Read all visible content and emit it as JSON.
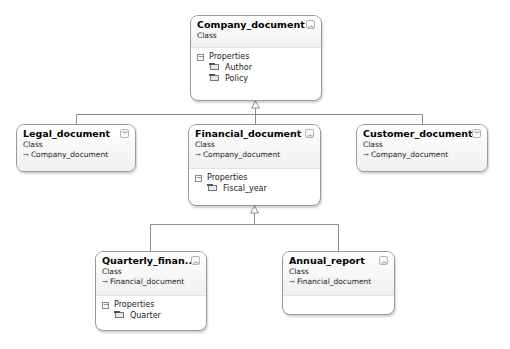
{
  "diagram": {
    "type": "class-diagram",
    "classes": [
      {
        "id": "company",
        "name": "Company_document",
        "kind": "Class",
        "base": null,
        "toggle": "collapse",
        "properties_label": "Properties",
        "properties": [
          "Author",
          "Policy"
        ]
      },
      {
        "id": "legal",
        "name": "Legal_document",
        "kind": "Class",
        "base": "Company_document",
        "toggle": "expand",
        "properties": []
      },
      {
        "id": "financial",
        "name": "Financial_document",
        "kind": "Class",
        "base": "Company_document",
        "toggle": "collapse",
        "properties_label": "Properties",
        "properties": [
          "Fiscal_year"
        ]
      },
      {
        "id": "customer",
        "name": "Customer_document",
        "kind": "Class",
        "base": "Company_document",
        "toggle": "expand",
        "properties": []
      },
      {
        "id": "quarterly",
        "name": "Quarterly_finan...",
        "kind": "Class",
        "base": "Financial_document",
        "toggle": "collapse",
        "properties_label": "Properties",
        "properties": [
          "Quarter"
        ]
      },
      {
        "id": "annual",
        "name": "Annual_report",
        "kind": "Class",
        "base": "Financial_document",
        "toggle": "collapse",
        "properties": []
      }
    ],
    "inheritance": [
      {
        "from": "Legal_document",
        "to": "Company_document"
      },
      {
        "from": "Financial_document",
        "to": "Company_document"
      },
      {
        "from": "Customer_document",
        "to": "Company_document"
      },
      {
        "from": "Quarterly_finan...",
        "to": "Financial_document"
      },
      {
        "from": "Annual_report",
        "to": "Financial_document"
      }
    ],
    "glyphs": {
      "collapse": "︽",
      "expand": "︾",
      "base_arrow": "⇾",
      "minus": "−"
    }
  }
}
